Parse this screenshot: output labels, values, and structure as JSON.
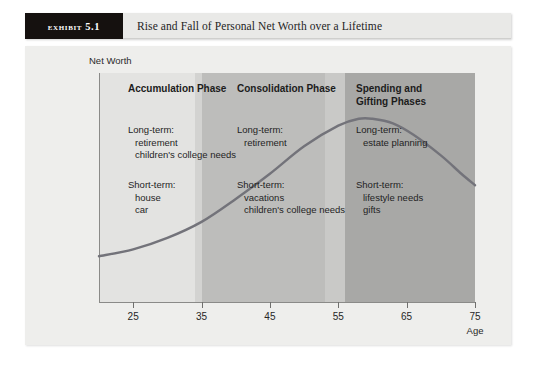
{
  "exhibit": {
    "tag": "Exhibit 5.1",
    "title": "Rise and Fall of Personal Net Worth over a Lifetime"
  },
  "chart_data": {
    "type": "line",
    "title": "Rise and Fall of Personal Net Worth over a Lifetime",
    "xlabel": "Age",
    "ylabel": "Net Worth",
    "xlim": [
      20,
      75
    ],
    "ylim": [
      0,
      100
    ],
    "grid": false,
    "legend": "none",
    "xticks": [
      25,
      35,
      45,
      55,
      65,
      75
    ],
    "series": [
      {
        "name": "Personal Net Worth",
        "color": "#73737a",
        "x": [
          20,
          25,
          30,
          35,
          40,
          45,
          50,
          55,
          58,
          60,
          63,
          66,
          70,
          73,
          75
        ],
        "y": [
          20,
          23,
          28,
          35,
          45,
          56,
          68,
          77,
          80,
          80,
          78,
          73,
          64,
          56,
          51
        ]
      }
    ],
    "bands": [
      {
        "name": "Accumulation Phase",
        "x_start": 20,
        "x_end": 34,
        "color": "#e3e3e1"
      },
      {
        "name": "Accumulation-Consolidation transition",
        "x_start": 34,
        "x_end": 35,
        "color": "#d3d3d1"
      },
      {
        "name": "Consolidation Phase",
        "x_start": 35,
        "x_end": 53,
        "color": "#bdbdbb"
      },
      {
        "name": "Consolidation-Spending transition",
        "x_start": 53,
        "x_end": 56,
        "color": "#c9c9c7"
      },
      {
        "name": "Spending and Gifting Phases",
        "x_start": 56,
        "x_end": 75,
        "color": "#a8a8a6"
      }
    ],
    "annotations": [
      {
        "id": "accumulation",
        "heading": "Accumulation Phase",
        "long_term_label": "Long-term:",
        "long_term_items": [
          "retirement",
          "children's college needs"
        ],
        "short_term_label": "Short-term:",
        "short_term_items": [
          "house",
          "car"
        ]
      },
      {
        "id": "consolidation",
        "heading": "Consolidation Phase",
        "long_term_label": "Long-term:",
        "long_term_items": [
          "retirement"
        ],
        "short_term_label": "Short-term:",
        "short_term_items": [
          "vacations",
          "children's college needs"
        ]
      },
      {
        "id": "spending",
        "heading": "Spending and\nGifting Phases",
        "heading_line1": "Spending and",
        "heading_line2": "Gifting Phases",
        "long_term_label": "Long-term:",
        "long_term_items": [
          "estate planning"
        ],
        "short_term_label": "Short-term:",
        "short_term_items": [
          "lifestyle needs",
          "gifts"
        ]
      }
    ]
  }
}
